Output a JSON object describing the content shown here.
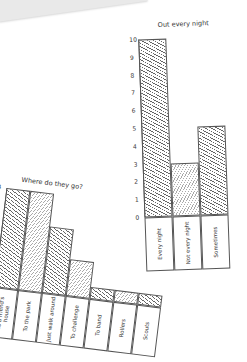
{
  "note": {
    "text": "some"
  },
  "chart_data": [
    {
      "type": "bar",
      "title": "Out every night",
      "categories": [
        "Every night",
        "Not every night",
        "Sometimes"
      ],
      "values": [
        10,
        3,
        5
      ],
      "hatch": [
        "a",
        "b",
        "a"
      ],
      "yticks": [
        "0",
        "1",
        "2",
        "3",
        "4",
        "5",
        "6",
        "7",
        "8",
        "9",
        "10"
      ],
      "ylim": [
        0,
        10
      ],
      "xlabel": "",
      "ylabel": ""
    },
    {
      "type": "bar",
      "title": "Where do they go?",
      "categories": [
        "To a friend's house",
        "To the park",
        "Just walk around",
        "To challenge",
        "To band",
        "Rollers",
        "Scouts"
      ],
      "values": [
        4,
        4,
        2.7,
        1.5,
        0.5,
        0.5,
        0.5
      ],
      "hatch": [
        "a",
        "b",
        "a",
        "b",
        "a",
        "b",
        "a"
      ],
      "yticks": [
        "0",
        "1",
        "2",
        "3",
        "4"
      ],
      "ylim": [
        0,
        4
      ],
      "xlabel": "",
      "ylabel": ""
    }
  ]
}
